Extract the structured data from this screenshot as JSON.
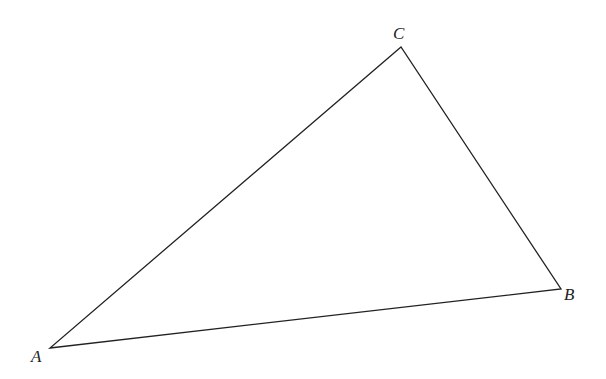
{
  "diagram": {
    "type": "triangle",
    "vertices": [
      {
        "name": "A",
        "x": 50,
        "y": 348,
        "label_x": 31,
        "label_y": 362
      },
      {
        "name": "B",
        "x": 561,
        "y": 289,
        "label_x": 564,
        "label_y": 300
      },
      {
        "name": "C",
        "x": 401,
        "y": 47,
        "label_x": 393,
        "label_y": 39
      }
    ],
    "edges": [
      [
        "A",
        "B"
      ],
      [
        "B",
        "C"
      ],
      [
        "C",
        "A"
      ]
    ],
    "stroke_color": "#222222"
  }
}
